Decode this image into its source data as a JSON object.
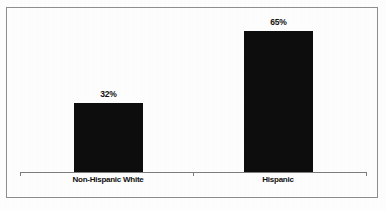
{
  "chart_data": {
    "type": "bar",
    "title": "",
    "subtitle": "",
    "xlabel": "",
    "ylabel": "",
    "categories": [
      "Non-Hispanic White",
      "Hispanic"
    ],
    "values": [
      32,
      65
    ],
    "value_labels": [
      "32%",
      "65%"
    ],
    "ylim": [
      0,
      78
    ],
    "grid": false,
    "legend": null,
    "legend_position": "none",
    "annotations": [],
    "series": [
      {
        "name": "",
        "values": [
          32,
          65
        ]
      }
    ]
  },
  "figure": {
    "border_color": "#8e8e8e",
    "background_color": "#fdfdfd",
    "bar_color": "#0d0d0d",
    "axis_color": "#7d7d7d",
    "text_color": "#111111"
  },
  "axis": {
    "tick_count": 3
  },
  "artifacts": {
    "bleed_text": ""
  }
}
